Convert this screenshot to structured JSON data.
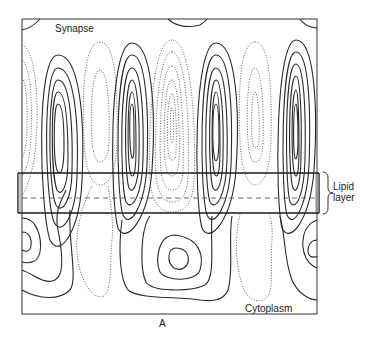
{
  "figure": {
    "type": "contour-diagram",
    "panel_label": "A",
    "labels": {
      "top_region": "Synapse",
      "bottom_region": "Cytoplasm",
      "band_line1": "Lipid",
      "band_line2": "layer"
    },
    "legend": {
      "solid_lines": "positive contours",
      "dotted_lines": "negative contours",
      "dashed_line": "membrane midplane"
    },
    "colors": {
      "line": "#2a2a2a",
      "background": "#ffffff"
    }
  }
}
